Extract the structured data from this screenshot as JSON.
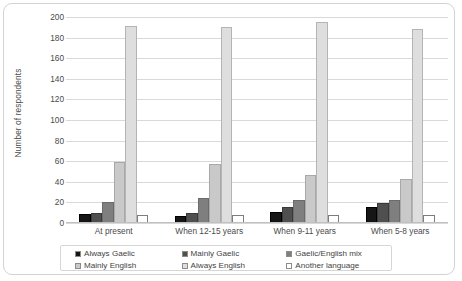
{
  "chart_data": {
    "type": "bar",
    "title": "",
    "xlabel": "",
    "ylabel": "Number of respondents",
    "ylim": [
      0,
      200
    ],
    "ytick_step": 20,
    "yticks": [
      200,
      180,
      160,
      140,
      120,
      100,
      80,
      60,
      40,
      20,
      0
    ],
    "grid": true,
    "legend_position": "bottom",
    "categories": [
      "At present",
      "When 12-15 years",
      "When 9-11 years",
      "When 5-8 years"
    ],
    "series": [
      {
        "name": "Always Gaelic",
        "color": "#161616",
        "values": [
          9,
          7,
          11,
          16
        ]
      },
      {
        "name": "Mainly Gaelic",
        "color": "#4f4f4f",
        "values": [
          10,
          10,
          16,
          19
        ]
      },
      {
        "name": "Gaelic/English mix",
        "color": "#7f7f7f",
        "values": [
          20,
          24,
          22,
          22
        ]
      },
      {
        "name": "Mainly English",
        "color": "#c9c9c9",
        "values": [
          59,
          57,
          47,
          43
        ]
      },
      {
        "name": "Always English",
        "color": "#dedede",
        "values": [
          191,
          190,
          195,
          188
        ]
      },
      {
        "name": "Another language",
        "color": "#ffffff",
        "values": [
          8,
          8,
          8,
          8
        ]
      }
    ]
  },
  "axis": {
    "y_title": "Number of respondents"
  }
}
